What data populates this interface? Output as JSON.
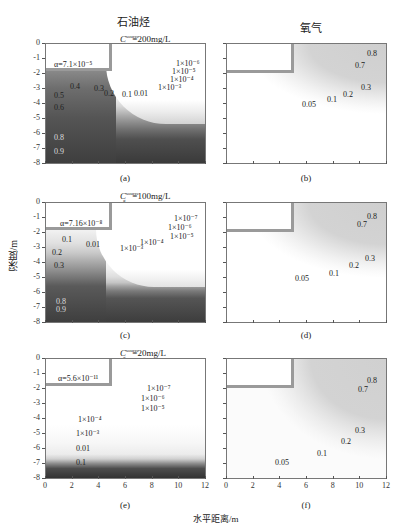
{
  "figure": {
    "col_titles": [
      "石油烃",
      "氧气"
    ],
    "ylabel": "深度/m",
    "xlabel": "水平距离/m",
    "yticks": [
      "0",
      "-1",
      "-2",
      "-3",
      "-4",
      "-5",
      "-6",
      "-7",
      "-8"
    ],
    "xticks": [
      "0",
      "2",
      "4",
      "6",
      "8",
      "10",
      "12"
    ],
    "rows": [
      {
        "source_label": "=200mg/L",
        "alpha_label": "α=7.1×10⁻⁵",
        "left_panel": "(a)",
        "right_panel": "(b)",
        "left_contours": [
          "0.9",
          "0.8",
          "0.6",
          "0.5",
          "0.4",
          "0.3",
          "0.2",
          "0.1",
          "0.01",
          "1×10⁻³",
          "1×10⁻⁴",
          "1×10⁻⁵",
          "1×10⁻⁶"
        ],
        "right_contours": [
          "0.8",
          "0.7",
          "0.3",
          "0.2",
          "0.1",
          "0.05"
        ]
      },
      {
        "source_label": "=100mg/L",
        "alpha_label": "α=7.16×10⁻⁸",
        "left_panel": "(c)",
        "right_panel": "(d)",
        "left_contours": [
          "0.9",
          "0.8",
          "0.3",
          "0.2",
          "0.1",
          "0.01",
          "1×10⁻³",
          "1×10⁻⁴",
          "1×10⁻⁵",
          "1×10⁻⁶",
          "1×10⁻⁷"
        ],
        "right_contours": [
          "0.8",
          "0.7",
          "0.3",
          "0.2",
          "0.1",
          "0.05"
        ]
      },
      {
        "source_label": "=20mg/L",
        "alpha_label": "α=5.6×10⁻¹¹",
        "left_panel": "(e)",
        "right_panel": "(f)",
        "left_contours": [
          "1×10⁻⁴",
          "1×10⁻³",
          "0.01",
          "0.1",
          "1×10⁻⁵",
          "1×10⁻⁶",
          "1×10⁻⁷"
        ],
        "right_contours": [
          "0.8",
          "0.7",
          "0.3",
          "0.2",
          "0.1",
          "0.05"
        ]
      }
    ],
    "csource_symbol": "C",
    "csource_sup": "source",
    "csource_sub": "g"
  },
  "chart_data": {
    "type": "heatmap",
    "xlabel": "水平距离/m",
    "ylabel": "深度/m",
    "xlim": [
      0,
      12
    ],
    "ylim": [
      -8,
      0
    ],
    "xticks": [
      0,
      2,
      4,
      6,
      8,
      10,
      12
    ],
    "yticks": [
      0,
      -1,
      -2,
      -3,
      -4,
      -5,
      -6,
      -7,
      -8
    ],
    "panels": [
      {
        "id": "a",
        "species": "石油烃",
        "source": "200mg/L",
        "alpha": "7.1e-5",
        "contour_levels": [
          0.9,
          0.8,
          0.6,
          0.5,
          0.4,
          0.3,
          0.2,
          0.1,
          0.01,
          0.001,
          0.0001,
          1e-05,
          1e-06
        ]
      },
      {
        "id": "b",
        "species": "氧气",
        "source": "200mg/L",
        "contour_levels": [
          0.8,
          0.7,
          0.3,
          0.2,
          0.1,
          0.05
        ]
      },
      {
        "id": "c",
        "species": "石油烃",
        "source": "100mg/L",
        "alpha": "7.16e-8",
        "contour_levels": [
          0.9,
          0.8,
          0.3,
          0.2,
          0.1,
          0.01,
          0.001,
          0.0001,
          1e-05,
          1e-06,
          1e-07
        ]
      },
      {
        "id": "d",
        "species": "氧气",
        "source": "100mg/L",
        "contour_levels": [
          0.8,
          0.7,
          0.3,
          0.2,
          0.1,
          0.05
        ]
      },
      {
        "id": "e",
        "species": "石油烃",
        "source": "20mg/L",
        "alpha": "5.6e-11",
        "contour_levels": [
          0.0001,
          0.001,
          0.01,
          0.1,
          1e-05,
          1e-06,
          1e-07
        ]
      },
      {
        "id": "f",
        "species": "氧气",
        "source": "20mg/L",
        "contour_levels": [
          0.8,
          0.7,
          0.3,
          0.2,
          0.1,
          0.05
        ]
      }
    ],
    "tank_region": {
      "x": [
        0,
        5
      ],
      "y": [
        -1.8,
        0
      ]
    }
  }
}
